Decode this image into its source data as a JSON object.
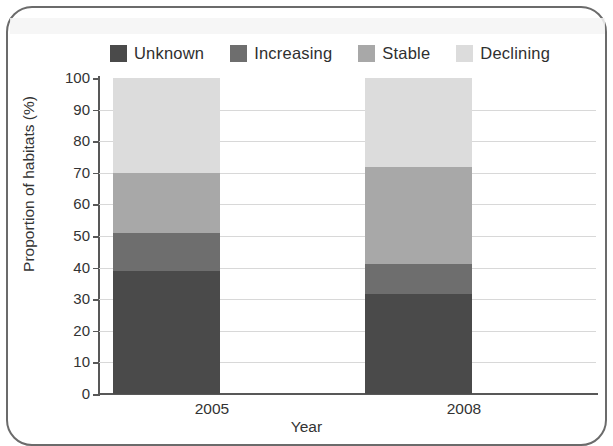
{
  "figure": {
    "frame_color": "#6b6b6b",
    "background": "#ffffff"
  },
  "legend": {
    "position": "top",
    "items": [
      {
        "label": "Unknown",
        "color": "#4a4a4a",
        "icon": "legend-swatch-icon"
      },
      {
        "label": "Increasing",
        "color": "#6e6e6e",
        "icon": "legend-swatch-icon"
      },
      {
        "label": "Stable",
        "color": "#a8a8a8",
        "icon": "legend-swatch-icon"
      },
      {
        "label": "Declining",
        "color": "#dcdcdc",
        "icon": "legend-swatch-icon"
      }
    ]
  },
  "axes": {
    "ylabel": "Proportion of habitats (%)",
    "xlabel": "Year",
    "yticks": [
      "0",
      "10",
      "20",
      "30",
      "40",
      "50",
      "60",
      "70",
      "80",
      "90",
      "100"
    ],
    "xticks": [
      "2005",
      "2008"
    ]
  },
  "chart_data": {
    "type": "bar",
    "subtype": "stacked-100",
    "title": "",
    "xlabel": "Year",
    "ylabel": "Proportion of habitats (%)",
    "categories": [
      "2005",
      "2008"
    ],
    "ylim": [
      0,
      100
    ],
    "ytick_step": 10,
    "grid": true,
    "legend_position": "top",
    "stack_order_bottom_to_top": [
      "Unknown",
      "Increasing",
      "Stable",
      "Declining"
    ],
    "series": [
      {
        "name": "Unknown",
        "color": "#4a4a4a",
        "values": [
          39,
          31.5
        ]
      },
      {
        "name": "Increasing",
        "color": "#6e6e6e",
        "values": [
          12,
          9.5
        ]
      },
      {
        "name": "Stable",
        "color": "#a8a8a8",
        "values": [
          19,
          31
        ]
      },
      {
        "name": "Declining",
        "color": "#dcdcdc",
        "values": [
          30,
          28
        ]
      }
    ],
    "cumulative_tops": {
      "2005": {
        "Unknown": 39,
        "Increasing": 51,
        "Stable": 70,
        "Declining": 100
      },
      "2008": {
        "Unknown": 31.5,
        "Increasing": 41,
        "Stable": 72,
        "Declining": 100
      }
    }
  }
}
